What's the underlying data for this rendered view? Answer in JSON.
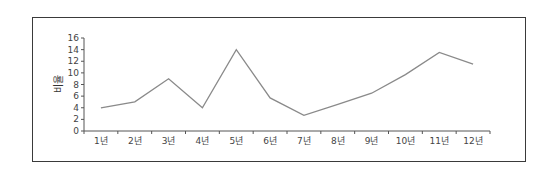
{
  "chart_data": {
    "type": "line",
    "title": "",
    "xlabel": "",
    "ylabel": "비율",
    "categories": [
      "1년",
      "2년",
      "3년",
      "4년",
      "5년",
      "6년",
      "7년",
      "8년",
      "9년",
      "10년",
      "11년",
      "12년"
    ],
    "series": [
      {
        "name": "비율",
        "values": [
          4,
          5,
          9,
          4,
          14,
          5.7,
          2.7,
          4.6,
          6.5,
          9.7,
          13.5,
          11.5
        ]
      }
    ],
    "ylim": [
      0,
      16
    ],
    "yticks": [
      0,
      2,
      4,
      6,
      8,
      10,
      12,
      14,
      16
    ],
    "grid": false,
    "legend": "none",
    "line_color": "#8a8a8a"
  }
}
